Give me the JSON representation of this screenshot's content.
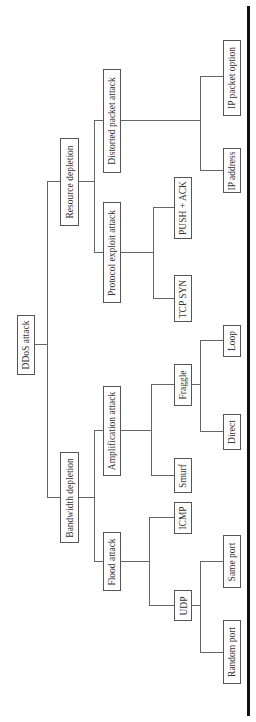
{
  "diagram": {
    "type": "tree",
    "orientation": "rotated-90-ccw",
    "root": {
      "label": "DDoS attack",
      "children": [
        {
          "label": "Bandwidth depletion",
          "children": [
            {
              "label": "Flood attack",
              "children": [
                {
                  "label": "UDP",
                  "children": [
                    {
                      "label": "Random port"
                    },
                    {
                      "label": "Same port"
                    }
                  ]
                },
                {
                  "label": "ICMP"
                }
              ]
            },
            {
              "label": "Amplification attack",
              "children": [
                {
                  "label": "Smurf"
                },
                {
                  "label": "Fraggle",
                  "children": [
                    {
                      "label": "Direct"
                    },
                    {
                      "label": "Loop"
                    }
                  ]
                }
              ]
            }
          ]
        },
        {
          "label": "Resource depletion",
          "children": [
            {
              "label": "Protocol exploit attack",
              "children": [
                {
                  "label": "TCP SYN"
                },
                {
                  "label": "PUSH + ACK"
                }
              ]
            },
            {
              "label": "Distorted packet attack",
              "children": [
                {
                  "label": "IP address"
                },
                {
                  "label": "IP packet option"
                }
              ]
            }
          ]
        }
      ]
    }
  },
  "nodes": {
    "ddos": "DDoS attack",
    "bandwidth": "Bandwidth depletion",
    "resource": "Resource depletion",
    "flood": "Flood attack",
    "amplification": "Amplification attack",
    "protocol": "Protocol exploit attack",
    "distorted": "Distorted packet attack",
    "udp": "UDP",
    "icmp": "ICMP",
    "smurf": "Smurf",
    "fraggle": "Fraggle",
    "tcpsyn": "TCP SYN",
    "pushack": "PUSH + ACK",
    "random_port": "Random port",
    "same_port": "Same port",
    "direct": "Direct",
    "loop": "Loop",
    "ip_address": "IP address",
    "ip_packet_option": "IP packet option"
  },
  "colors": {
    "line": "#666666",
    "border": "#555555",
    "text": "#333333",
    "rule": "#111111"
  }
}
